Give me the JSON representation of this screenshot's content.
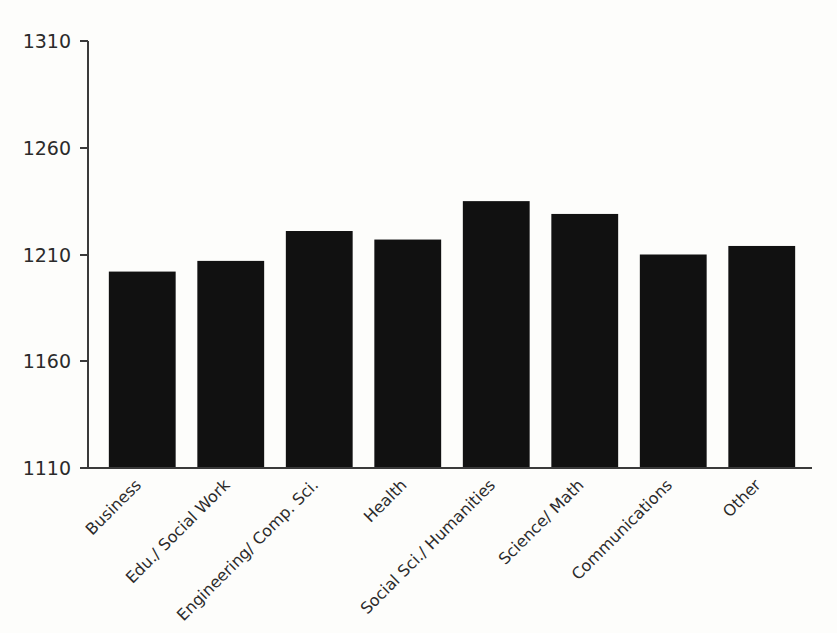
{
  "chart_data": {
    "type": "bar",
    "title": "",
    "subtitle": "",
    "xlabel": "",
    "ylabel": "",
    "categories": [
      "Business",
      "Edu./ Social Work",
      "Engineering/ Comp. Sci.",
      "Health",
      "Social Sci./ Humanities",
      "Science/ Math",
      "Communications",
      "Other"
    ],
    "values": [
      1202,
      1207,
      1221,
      1217,
      1235,
      1229,
      1210,
      1214
    ],
    "ylim": [
      1110,
      1310
    ],
    "yticks": [
      1110,
      1160,
      1210,
      1260,
      1310
    ],
    "ytick_labels": [
      "1110",
      "1160",
      "1210",
      "1260",
      "1310"
    ],
    "grid": false,
    "legend": null,
    "legend_position": "none",
    "bar_color": "#111111",
    "axis_color": "#3a3a3a",
    "background_color": "#fdfdfb",
    "xtick_rotation_deg": -45,
    "annotations": []
  }
}
